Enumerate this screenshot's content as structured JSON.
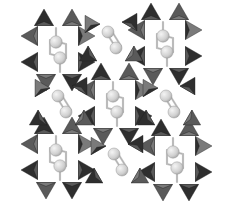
{
  "diagram": {
    "type": "crystal-structure-polyhedral",
    "background": "#ffffff",
    "colors": {
      "tetra_dark": "#2e2e2e",
      "tetra_mid": "#5a5a5a",
      "tetra_light": "#7a7a7a",
      "atom_fill": "#d8d8d8",
      "atom_stroke": "#9a9a9a",
      "bond": "#c8c8c8"
    },
    "units": [
      {
        "cx": 58,
        "cy": 50
      },
      {
        "cx": 165,
        "cy": 44
      },
      {
        "cx": 58,
        "cy": 158
      },
      {
        "cx": 175,
        "cy": 160
      },
      {
        "cx": 115,
        "cy": 104
      }
    ],
    "side_units": [
      {
        "cx": 62,
        "cy": 104
      },
      {
        "cx": 170,
        "cy": 104
      },
      {
        "cx": 112,
        "cy": 40
      },
      {
        "cx": 118,
        "cy": 162
      }
    ]
  }
}
